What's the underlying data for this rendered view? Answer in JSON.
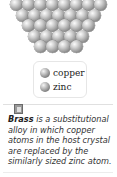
{
  "figure": {
    "type": "crystal-lattice-illustration",
    "lattice_rows": [
      8,
      7,
      6,
      5,
      4
    ],
    "sphere_color": "#9a9a9a"
  },
  "legend": {
    "items": [
      {
        "label": "copper",
        "icon": "copper-atom-sphere-icon"
      },
      {
        "label": "zinc",
        "icon": "zinc-atom-sphere-icon"
      }
    ]
  },
  "caption": {
    "badge_icon": "figure-marker-icon",
    "term": "Brass",
    "text": " is a substitutional alloy in which copper atoms in the host crystal are replaced by the similarly sized zinc atom."
  }
}
